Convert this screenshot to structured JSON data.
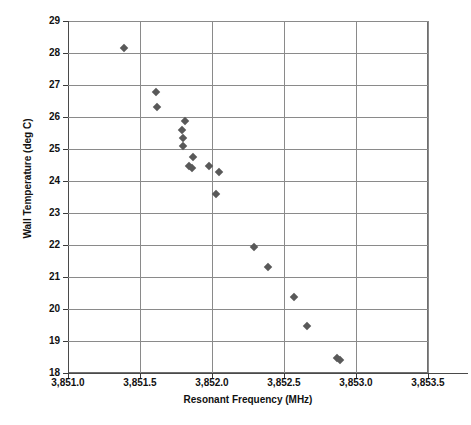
{
  "chart_data": {
    "type": "scatter",
    "title": "",
    "xlabel": "Resonant Frequency (MHz)",
    "ylabel": "Wall Temperature (deg C)",
    "xlim": [
      3851.0,
      3853.5
    ],
    "ylim": [
      18,
      29
    ],
    "xticks": [
      3851.0,
      3851.5,
      3852.0,
      3852.5,
      3853.0,
      3853.5
    ],
    "xtick_labels": [
      "3,851.0",
      "3,851.5",
      "3,852.0",
      "3,852.5",
      "3,853.0",
      "3,853.5"
    ],
    "yticks": [
      18,
      19,
      20,
      21,
      22,
      23,
      24,
      25,
      26,
      27,
      28,
      29
    ],
    "ytick_labels": [
      "18",
      "19",
      "20",
      "21",
      "22",
      "23",
      "24",
      "25",
      "26",
      "27",
      "28",
      "29"
    ],
    "grid": "horizontal-and-vertical",
    "legend": "none",
    "marker": "diamond",
    "marker_color": "#595959",
    "series": [
      {
        "name": "Wall Temperature vs Resonant Frequency",
        "points": [
          {
            "x": 3851.39,
            "y": 28.16
          },
          {
            "x": 3851.61,
            "y": 26.77
          },
          {
            "x": 3851.62,
            "y": 26.3
          },
          {
            "x": 3851.81,
            "y": 25.88
          },
          {
            "x": 3851.79,
            "y": 25.6
          },
          {
            "x": 3851.8,
            "y": 25.35
          },
          {
            "x": 3851.8,
            "y": 25.1
          },
          {
            "x": 3851.87,
            "y": 24.76
          },
          {
            "x": 3851.84,
            "y": 24.48
          },
          {
            "x": 3851.86,
            "y": 24.41
          },
          {
            "x": 3851.98,
            "y": 24.48
          },
          {
            "x": 3852.05,
            "y": 24.28
          },
          {
            "x": 3852.03,
            "y": 23.58
          },
          {
            "x": 3852.29,
            "y": 21.95
          },
          {
            "x": 3852.39,
            "y": 21.3
          },
          {
            "x": 3852.57,
            "y": 20.38
          },
          {
            "x": 3852.66,
            "y": 19.47
          },
          {
            "x": 3852.87,
            "y": 18.48
          },
          {
            "x": 3852.89,
            "y": 18.42
          }
        ]
      }
    ]
  }
}
